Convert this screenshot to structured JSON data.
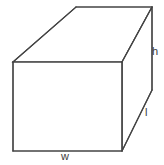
{
  "figure": {
    "name": "rectangular-prism",
    "stroke_color": "#444444",
    "fill_color": "#ffffff",
    "background_color": "#ffffff",
    "stroke_width": 1.2,
    "width_px": 164,
    "height_px": 165
  },
  "labels": {
    "height": "h",
    "length": "l",
    "width": "w"
  },
  "geometry": {
    "front_top_left": [
      13,
      62
    ],
    "front_top_right": [
      122,
      62
    ],
    "front_bottom_left": [
      13,
      151
    ],
    "front_bottom_right": [
      122,
      151
    ],
    "back_top_left": [
      76,
      7
    ],
    "back_top_right": [
      152,
      7
    ],
    "back_bottom_right": [
      152,
      90
    ],
    "front_face": "13,62 122,62 122,151 13,151",
    "top_face": "13,62 76,7 152,7 122,62",
    "right_face": "122,62 152,7 152,90 122,151"
  }
}
